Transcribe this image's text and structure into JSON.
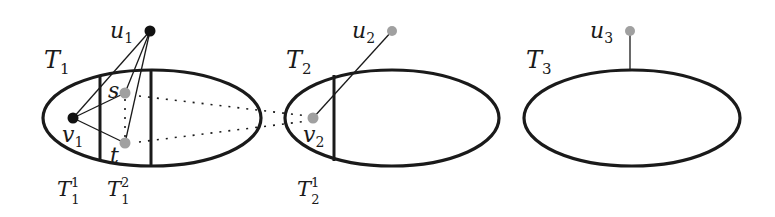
{
  "diagram": {
    "colors": {
      "stroke": "#1a1a1a",
      "black_node": "#111111",
      "gray_node": "#a0a0a0",
      "background": "#ffffff"
    },
    "components": [
      {
        "id": "T1",
        "label": "T",
        "label_sub": "1",
        "ellipse": {
          "cx": 152,
          "cy": 118,
          "rx": 109,
          "ry": 48
        },
        "parts": [
          {
            "label": "T",
            "sub": "1",
            "sup": "1",
            "divider_x": 100
          },
          {
            "label": "T",
            "sub": "1",
            "sup": "2",
            "divider_x": 151
          }
        ]
      },
      {
        "id": "T2",
        "label": "T",
        "label_sub": "2",
        "ellipse": {
          "cx": 392,
          "cy": 118,
          "rx": 107,
          "ry": 48
        },
        "parts": [
          {
            "label": "T",
            "sub": "2",
            "sup": "1",
            "divider_x": 334
          }
        ]
      },
      {
        "id": "T3",
        "label": "T",
        "label_sub": "3",
        "ellipse": {
          "cx": 632,
          "cy": 118,
          "rx": 108,
          "ry": 48
        },
        "parts": []
      }
    ],
    "nodes": [
      {
        "id": "u1",
        "label": "u",
        "sub": "1",
        "x": 150,
        "y": 31,
        "fill": "black"
      },
      {
        "id": "u2",
        "label": "u",
        "sub": "2",
        "x": 392,
        "y": 31,
        "fill": "gray"
      },
      {
        "id": "u3",
        "label": "u",
        "sub": "3",
        "x": 630,
        "y": 31,
        "fill": "gray"
      },
      {
        "id": "v1",
        "label": "v",
        "sub": "1",
        "x": 73,
        "y": 118,
        "fill": "black"
      },
      {
        "id": "v2",
        "label": "v",
        "sub": "2",
        "x": 313,
        "y": 118,
        "fill": "gray"
      },
      {
        "id": "s",
        "label": "s",
        "x": 125,
        "y": 93,
        "fill": "gray"
      },
      {
        "id": "t",
        "label": "t",
        "x": 125,
        "y": 143,
        "fill": "gray"
      }
    ],
    "edges": [
      {
        "from": "u1",
        "to": "v1",
        "style": "solid"
      },
      {
        "from": "u1",
        "to": "s",
        "style": "solid"
      },
      {
        "from": "u1",
        "to": "t",
        "style": "solid"
      },
      {
        "from": "v1",
        "to": "s",
        "style": "solid"
      },
      {
        "from": "v1",
        "to": "t",
        "style": "solid"
      },
      {
        "from": "u2",
        "to": "v2",
        "style": "solid"
      },
      {
        "from": "u3",
        "to": "T3",
        "style": "solid"
      },
      {
        "from": "s",
        "to": "t",
        "style": "dotted"
      },
      {
        "from": "s",
        "to": "v2",
        "style": "dotted"
      },
      {
        "from": "t",
        "to": "v2",
        "style": "dotted"
      }
    ]
  }
}
